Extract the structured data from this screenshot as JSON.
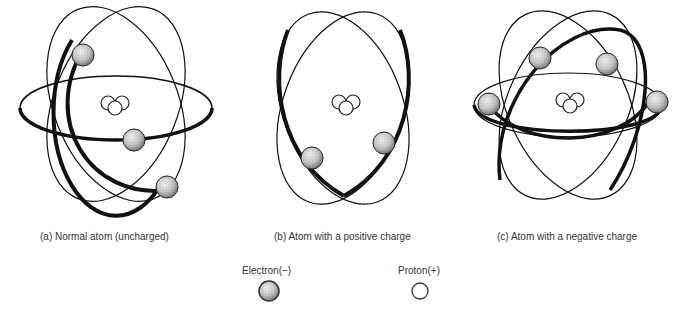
{
  "figures": [
    {
      "id": "a",
      "caption": "(a) Normal atom (uncharged)",
      "electrons": 3,
      "protons": 3
    },
    {
      "id": "b",
      "caption": "(b) Atom with a positive charge",
      "electrons": 2,
      "protons": 3
    },
    {
      "id": "c",
      "caption": "(c) Atom with a negative charge",
      "electrons": 4,
      "protons": 3
    }
  ],
  "legend": {
    "electron_label": "Electron(−)",
    "proton_label": "Proton(+)"
  },
  "colors": {
    "orbit": "#111111",
    "electron_fill": "#bdbdbd",
    "proton_fill": "#ffffff",
    "text": "#333333"
  }
}
